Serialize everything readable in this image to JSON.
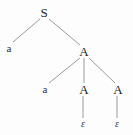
{
  "figure": {
    "background_color": "#fdfdfd",
    "edge_color": "#9a9a9a",
    "text_color": "#2b2b2b"
  },
  "nodes": [
    {
      "id": "n0",
      "label": "S",
      "kind": "nonterminal",
      "x": 44,
      "y": 12
    },
    {
      "id": "n1",
      "label": "a",
      "kind": "terminal",
      "x": 9,
      "y": 48
    },
    {
      "id": "n2",
      "label": "A",
      "kind": "nonterminal",
      "x": 84,
      "y": 51
    },
    {
      "id": "n3",
      "label": "a",
      "kind": "terminal",
      "x": 45,
      "y": 89
    },
    {
      "id": "n4",
      "label": "A",
      "kind": "nonterminal",
      "x": 84,
      "y": 89
    },
    {
      "id": "n5",
      "label": "A",
      "kind": "nonterminal",
      "x": 118,
      "y": 89
    },
    {
      "id": "n6",
      "label": "ε",
      "kind": "empty-string",
      "x": 83,
      "y": 124
    },
    {
      "id": "n7",
      "label": "ε",
      "kind": "empty-string",
      "x": 117,
      "y": 124
    }
  ],
  "edges": [
    {
      "from": "n0",
      "to": "n1",
      "x1": 40,
      "y1": 19,
      "x2": 13,
      "y2": 42
    },
    {
      "from": "n0",
      "to": "n2",
      "x1": 49,
      "y1": 19,
      "x2": 80,
      "y2": 45
    },
    {
      "from": "n2",
      "to": "n3",
      "x1": 80,
      "y1": 58,
      "x2": 49,
      "y2": 83
    },
    {
      "from": "n2",
      "to": "n4",
      "x1": 84,
      "y1": 58,
      "x2": 84,
      "y2": 83
    },
    {
      "from": "n2",
      "to": "n5",
      "x1": 89,
      "y1": 58,
      "x2": 115,
      "y2": 83
    },
    {
      "from": "n4",
      "to": "n6",
      "x1": 83,
      "y1": 96,
      "x2": 83,
      "y2": 118
    },
    {
      "from": "n5",
      "to": "n7",
      "x1": 117,
      "y1": 96,
      "x2": 117,
      "y2": 118
    }
  ]
}
